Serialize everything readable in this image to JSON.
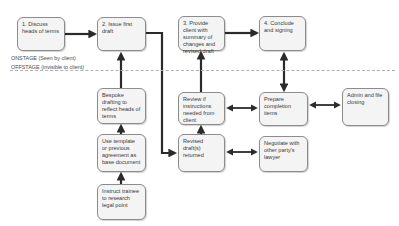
{
  "diagram": {
    "stage_labels": {
      "onstage": "ONSTAGE (Seen by client)",
      "offstage": "OFFSTAGE (invisible to client)"
    },
    "nodes": [
      {
        "id": "discuss",
        "label": "1. Discuss heads of terms"
      },
      {
        "id": "issue",
        "label": "2. Issue first draft"
      },
      {
        "id": "provide",
        "label": "3. Provide client with summary of changes and revised draft"
      },
      {
        "id": "conclude",
        "label": "4. Conclude and signing"
      },
      {
        "id": "bespoke",
        "label": "Bespoke drafting to reflect heads of terms"
      },
      {
        "id": "review",
        "label": "Review if instructions needed from client"
      },
      {
        "id": "prepare",
        "label": "Prepare completion items"
      },
      {
        "id": "admin",
        "label": "Admin and file closing"
      },
      {
        "id": "template",
        "label": "Use template or previous agreement as base document"
      },
      {
        "id": "revised",
        "label": "Revised draft(s) returned"
      },
      {
        "id": "negotiate",
        "label": "Negotiate with other party's lawyer"
      },
      {
        "id": "instruct",
        "label": "Instruct trainee to research legal point"
      }
    ],
    "edges": [
      {
        "from": "discuss",
        "to": "issue",
        "type": "single"
      },
      {
        "from": "issue",
        "to": "revised",
        "type": "single"
      },
      {
        "from": "provide",
        "to": "conclude",
        "type": "single"
      },
      {
        "from": "bespoke",
        "to": "issue",
        "type": "single"
      },
      {
        "from": "template",
        "to": "bespoke",
        "type": "single"
      },
      {
        "from": "instruct",
        "to": "template",
        "type": "single"
      },
      {
        "from": "revised",
        "to": "review",
        "type": "single"
      },
      {
        "from": "review",
        "to": "provide",
        "type": "single"
      },
      {
        "from": "review",
        "to": "prepare",
        "type": "double"
      },
      {
        "from": "prepare",
        "to": "admin",
        "type": "double"
      },
      {
        "from": "prepare",
        "to": "conclude",
        "type": "double"
      },
      {
        "from": "revised",
        "to": "negotiate",
        "type": "double"
      }
    ],
    "colors": {
      "arrow": "#2b2b2b",
      "box_border": "#8c8c8c",
      "box_fill": "#f4f4f4",
      "divider": "#b0b0b0"
    }
  }
}
